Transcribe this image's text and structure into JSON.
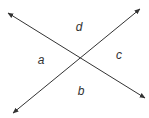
{
  "diagram": {
    "line_color": "#333333",
    "label_color": "#333333",
    "lines": [
      {
        "name": "line-descending",
        "x1": 8,
        "y1": 13,
        "x2": 145,
        "y2": 98
      },
      {
        "name": "line-ascending",
        "x1": 13,
        "y1": 113,
        "x2": 140,
        "y2": 9
      }
    ],
    "intersection": {
      "x": 81,
      "y": 59
    },
    "angles": [
      {
        "label": "d",
        "x": 79,
        "y": 31,
        "position": "top"
      },
      {
        "label": "a",
        "x": 41,
        "y": 64,
        "position": "left"
      },
      {
        "label": "c",
        "x": 119,
        "y": 59,
        "position": "right"
      },
      {
        "label": "b",
        "x": 81,
        "y": 95,
        "position": "bottom"
      }
    ]
  }
}
